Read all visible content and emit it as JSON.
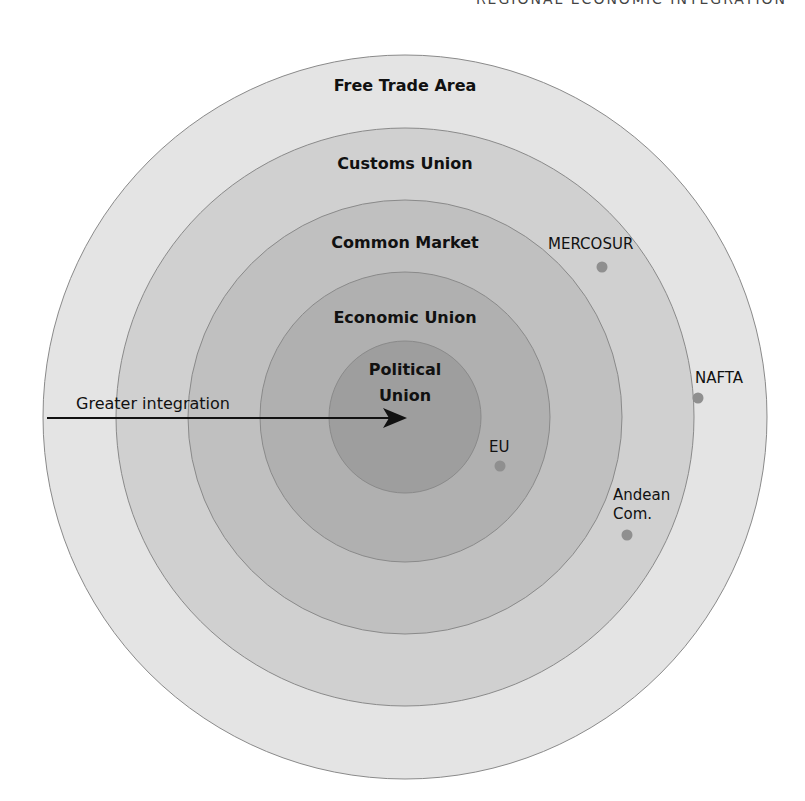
{
  "header": {
    "title": "REGIONAL ECONOMIC INTEGRATION"
  },
  "diagram": {
    "center": {
      "x": 405,
      "y": 417
    },
    "rings": [
      {
        "label": "Free Trade Area",
        "radius": 362,
        "color": "#e4e4e4",
        "label_y": 91
      },
      {
        "label": "Customs Union",
        "radius": 289,
        "color": "#d0d0d0",
        "label_y": 169
      },
      {
        "label": "Common Market",
        "radius": 217,
        "color": "#c0c0c0",
        "label_y": 248
      },
      {
        "label": "Economic Union",
        "radius": 145,
        "color": "#b0b0b0",
        "label_y": 323
      }
    ],
    "core": {
      "label_line1": "Political",
      "label_line2": "Union",
      "radius": 76,
      "color": "#9e9e9e"
    },
    "arrow": {
      "label": "Greater integration",
      "x1": 47,
      "y": 418,
      "x2": 403
    },
    "members": [
      {
        "name": "MERCOSUR",
        "dot": {
          "x": 602,
          "y": 267
        },
        "label_x": 548,
        "label_y": 249
      },
      {
        "name": "NAFTA",
        "dot": {
          "x": 698,
          "y": 398
        },
        "label_x": 695,
        "label_y": 383
      },
      {
        "name": "EU",
        "dot": {
          "x": 500,
          "y": 466
        },
        "label_x": 489,
        "label_y": 452
      },
      {
        "name": "Andean",
        "name2": "Com.",
        "dot": {
          "x": 627,
          "y": 535
        },
        "label_x": 613,
        "label_y": 500
      }
    ],
    "dot_color": "#8f8f8f"
  }
}
